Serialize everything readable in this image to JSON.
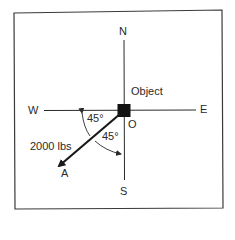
{
  "diagram": {
    "type": "force-vector",
    "directions": {
      "north": "N",
      "south": "S",
      "east": "E",
      "west": "W"
    },
    "object_label": "Object",
    "origin_label": "O",
    "force": {
      "magnitude_label": "2000 lbs",
      "end_label": "A"
    },
    "angles": {
      "from_west": "45°",
      "from_south": "45°"
    },
    "colors": {
      "line": "#2a2a2a",
      "frame": "#3a3a3a",
      "background": "#ffffff"
    }
  }
}
